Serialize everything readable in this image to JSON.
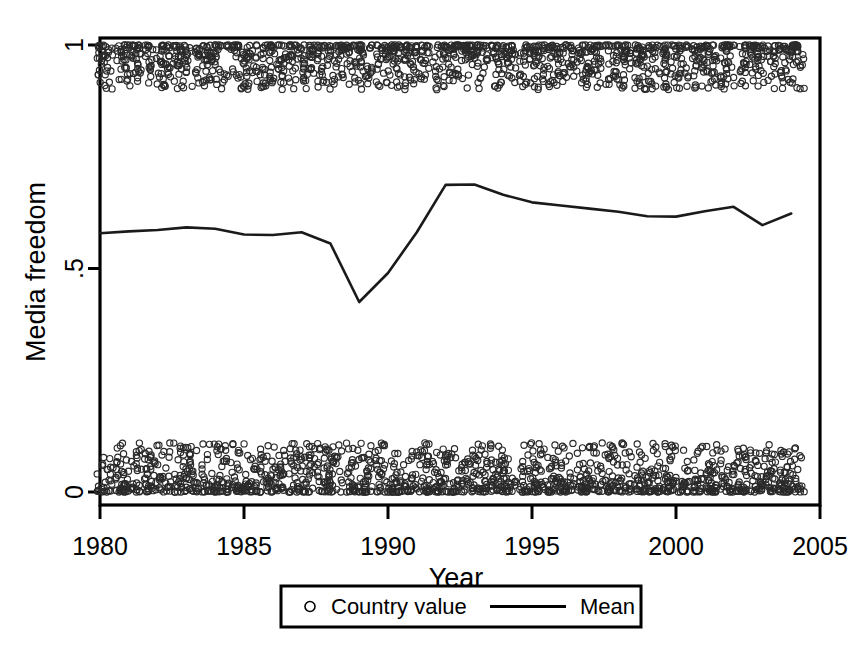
{
  "chart_data": {
    "type": "scatter",
    "title": "",
    "xlabel": "Year",
    "ylabel": "Media freedom",
    "xlim": [
      1980,
      2005
    ],
    "ylim": [
      0,
      1
    ],
    "grid": false,
    "xticks": [
      "1980",
      "1985",
      "1990",
      "1995",
      "2000",
      "2005"
    ],
    "xtick_values": [
      1980,
      1985,
      1990,
      1995,
      2000,
      2005
    ],
    "yticks": [
      "0",
      ".5",
      "1"
    ],
    "ytick_values": [
      0,
      0.5,
      1
    ],
    "legend_position": "below-center",
    "legend": [
      {
        "label": "Country value",
        "marker": "circle-open"
      },
      {
        "label": "Mean",
        "marker": "line"
      }
    ],
    "series": [
      {
        "name": "Mean",
        "type": "line",
        "x": [
          1980,
          1981,
          1982,
          1983,
          1984,
          1985,
          1986,
          1987,
          1988,
          1989,
          1990,
          1991,
          1992,
          1993,
          1994,
          1995,
          1996,
          1997,
          1998,
          1999,
          2000,
          2001,
          2002,
          2003,
          2004
        ],
        "values": [
          0.579,
          0.583,
          0.586,
          0.592,
          0.589,
          0.576,
          0.575,
          0.581,
          0.556,
          0.425,
          0.49,
          0.581,
          0.687,
          0.688,
          0.665,
          0.648,
          0.641,
          0.634,
          0.627,
          0.617,
          0.616,
          0.628,
          0.638,
          0.597,
          0.623
        ]
      },
      {
        "name": "Country value",
        "type": "scatter",
        "description": "Country-year observations, bimodal: dense cluster near 1 (free media) and dense cluster near 0 (not free), spanning 1980-2005",
        "cluster_high_center": 0.975,
        "cluster_high_spread": [
          0.9,
          1.0
        ],
        "cluster_low_center": 0.02,
        "cluster_low_spread": [
          0.0,
          0.11
        ],
        "points_per_year_high": 60,
        "points_per_year_low": 62
      }
    ]
  },
  "colors": {
    "line": "#1a1a1a",
    "marker": "#2a2a2a",
    "frame": "#000000",
    "background": "#ffffff"
  }
}
